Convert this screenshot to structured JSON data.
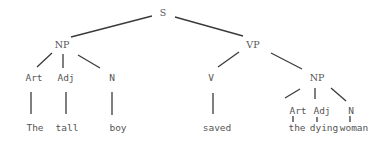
{
  "diagram": {
    "type": "syntax-tree",
    "sentence": "The tall boy saved the dying woman",
    "nodes": {
      "s": {
        "label": "S",
        "x": 163,
        "y": 13
      },
      "np1": {
        "label": "NP",
        "x": 62,
        "y": 45
      },
      "vp": {
        "label": "VP",
        "x": 253,
        "y": 45
      },
      "art1": {
        "label": "Art",
        "x": 34,
        "y": 78
      },
      "adj1": {
        "label": "Adj",
        "x": 66,
        "y": 78
      },
      "n1": {
        "label": "N",
        "x": 112,
        "y": 78
      },
      "v": {
        "label": "V",
        "x": 211,
        "y": 78
      },
      "np2": {
        "label": "NP",
        "x": 317,
        "y": 78
      },
      "art2": {
        "label": "Art",
        "x": 298,
        "y": 111
      },
      "adj2": {
        "label": "Adj",
        "x": 322,
        "y": 111
      },
      "n2": {
        "label": "N",
        "x": 351,
        "y": 111
      },
      "w_the1": {
        "label": "The",
        "x": 35,
        "y": 128
      },
      "w_tall": {
        "label": "tall",
        "x": 67,
        "y": 128
      },
      "w_boy": {
        "label": "boy",
        "x": 118,
        "y": 128
      },
      "w_saved": {
        "label": "saved",
        "x": 217,
        "y": 128
      },
      "w_the2": {
        "label": "the",
        "x": 297,
        "y": 128
      },
      "w_dying": {
        "label": "dying",
        "x": 324,
        "y": 128
      },
      "w_woman": {
        "label": "woman",
        "x": 354,
        "y": 128
      }
    },
    "edges": [
      {
        "from": "s",
        "to": "np1",
        "x1": 152,
        "y1": 16,
        "x2": 71,
        "y2": 37
      },
      {
        "from": "s",
        "to": "vp",
        "x1": 175,
        "y1": 17,
        "x2": 243,
        "y2": 36
      },
      {
        "from": "np1",
        "to": "art1",
        "x1": 52,
        "y1": 53,
        "x2": 37,
        "y2": 67
      },
      {
        "from": "np1",
        "to": "adj1",
        "x1": 63,
        "y1": 54,
        "x2": 63,
        "y2": 68
      },
      {
        "from": "np1",
        "to": "n1",
        "x1": 78,
        "y1": 55,
        "x2": 100,
        "y2": 68
      },
      {
        "from": "vp",
        "to": "v",
        "x1": 239,
        "y1": 52,
        "x2": 218,
        "y2": 67
      },
      {
        "from": "vp",
        "to": "np2",
        "x1": 271,
        "y1": 53,
        "x2": 302,
        "y2": 69
      },
      {
        "from": "art1",
        "to": "w_the1",
        "x1": 31,
        "y1": 92,
        "x2": 31,
        "y2": 114
      },
      {
        "from": "adj1",
        "to": "w_tall",
        "x1": 66,
        "y1": 92,
        "x2": 66,
        "y2": 114
      },
      {
        "from": "n1",
        "to": "w_boy",
        "x1": 112,
        "y1": 92,
        "x2": 112,
        "y2": 115
      },
      {
        "from": "v",
        "to": "w_saved",
        "x1": 213,
        "y1": 93,
        "x2": 213,
        "y2": 114
      },
      {
        "from": "np2",
        "to": "art2",
        "x1": 300,
        "y1": 89,
        "x2": 285,
        "y2": 98
      },
      {
        "from": "np2",
        "to": "adj2",
        "x1": 315,
        "y1": 88,
        "x2": 315,
        "y2": 99
      },
      {
        "from": "np2",
        "to": "n2",
        "x1": 331,
        "y1": 88,
        "x2": 346,
        "y2": 101
      },
      {
        "from": "art2",
        "to": "w_the2",
        "x1": 293,
        "y1": 116,
        "x2": 293,
        "y2": 122
      },
      {
        "from": "adj2",
        "to": "w_dying",
        "x1": 317,
        "y1": 117,
        "x2": 317,
        "y2": 122
      },
      {
        "from": "n2",
        "to": "w_woman",
        "x1": 350,
        "y1": 116,
        "x2": 350,
        "y2": 122
      }
    ]
  }
}
